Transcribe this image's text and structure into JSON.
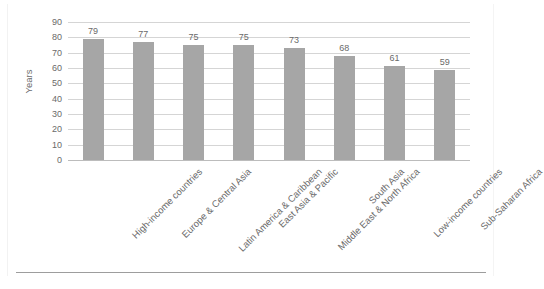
{
  "chart_data": {
    "type": "bar",
    "title": "",
    "subtitle": "",
    "xlabel": "",
    "ylabel": "Years",
    "ylim": [
      0,
      90
    ],
    "ytick_step": 10,
    "yticks": [
      "90",
      "80",
      "70",
      "60",
      "50",
      "40",
      "30",
      "20",
      "10",
      "0"
    ],
    "grid": true,
    "legend": false,
    "legend_position": "none",
    "bar_color": "#a6a6a6",
    "gridline_color": "#d5d5d5",
    "text_color": "#6a6a6a",
    "label_rotation_deg": -45,
    "show_value_labels": true,
    "categories": [
      "High-income countries",
      "Europe & Central Asia",
      "Latin America & Caribbean",
      "East Asia & Pacific",
      "Middle East & North Africa",
      "South Asia",
      "Low-income countries",
      "Sub-Saharan Africa"
    ],
    "values": [
      79,
      77,
      75,
      75,
      73,
      68,
      61,
      59
    ],
    "value_labels": [
      "79",
      "77",
      "75",
      "75",
      "73",
      "68",
      "61",
      "59"
    ]
  }
}
